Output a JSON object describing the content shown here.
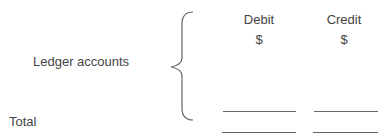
{
  "labels": {
    "ledger_accounts": "Ledger accounts",
    "total": "Total"
  },
  "columns": [
    {
      "header": "Debit",
      "unit": "$"
    },
    {
      "header": "Credit",
      "unit": "$"
    }
  ],
  "colors": {
    "text": "#444444",
    "lines": "#666666"
  }
}
